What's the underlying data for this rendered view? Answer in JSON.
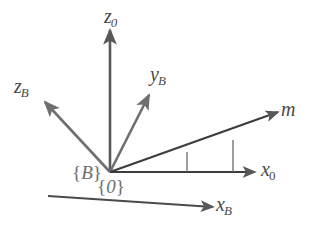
{
  "figure": {
    "background_color": "#ffffff",
    "axis_color": "#585858",
    "light_axis_color": "#6f6f6f",
    "label_color": "#4a4a4a",
    "frame_label_color": "#6d6d6d",
    "origin": {
      "x": 110,
      "y": 172
    }
  },
  "axes": [
    {
      "id": "z0",
      "name": "z-zero-axis",
      "base": "z",
      "sub": "0",
      "label_x": 104,
      "label_y": 6,
      "from": {
        "x": 110,
        "y": 172
      },
      "to": {
        "x": 110,
        "y": 30
      },
      "arrow": true
    },
    {
      "id": "zB",
      "name": "z-body-axis",
      "base": "z",
      "sub": "B",
      "label_x": 14,
      "label_y": 76,
      "from": {
        "x": 110,
        "y": 172
      },
      "to": {
        "x": 45,
        "y": 102
      },
      "arrow": true
    },
    {
      "id": "yB",
      "name": "y-body-axis",
      "base": "y",
      "sub": "B",
      "label_x": 150,
      "label_y": 64,
      "from": {
        "x": 110,
        "y": 172
      },
      "to": {
        "x": 149,
        "y": 95
      },
      "arrow": true
    },
    {
      "id": "m",
      "name": "m-vector",
      "base": "m",
      "sub": "",
      "label_x": 281,
      "label_y": 99,
      "from": {
        "x": 110,
        "y": 172
      },
      "to": {
        "x": 278,
        "y": 112
      },
      "arrow": true
    },
    {
      "id": "x0",
      "name": "x-zero-axis",
      "base": "x",
      "sub": "0",
      "label_x": 261,
      "label_y": 159,
      "from": {
        "x": 110,
        "y": 172
      },
      "to": {
        "x": 255,
        "y": 172
      },
      "arrow": true
    },
    {
      "id": "xB",
      "name": "x-body-axis",
      "base": "x",
      "sub": "B",
      "label_x": 216,
      "label_y": 194,
      "from": {
        "x": 48,
        "y": 196
      },
      "to": {
        "x": 213,
        "y": 207
      },
      "arrow": true
    }
  ],
  "frame_labels": [
    {
      "id": "B",
      "name": "body-frame-label",
      "text": "{B}",
      "base": "B",
      "x": 72,
      "y": 163
    },
    {
      "id": "0",
      "name": "inertial-frame-label",
      "text": "{0}",
      "base": "0",
      "x": 97,
      "y": 177
    }
  ],
  "projection_lines": [
    {
      "id": "tick-inner",
      "name": "projection-line-inner",
      "x": 187,
      "y_top": 152,
      "y_bottom": 172
    },
    {
      "id": "tick-outer",
      "name": "projection-line-outer",
      "x": 233,
      "y_top": 140,
      "y_bottom": 172
    }
  ]
}
